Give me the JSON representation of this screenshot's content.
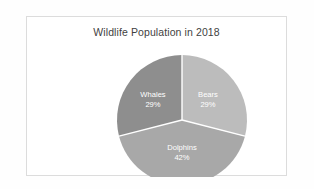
{
  "frame": {
    "border_color": "#dcdcdc",
    "background": "#ffffff"
  },
  "chart_data": {
    "type": "pie",
    "title": "Wildlife Population in 2018",
    "xlabel": "",
    "ylabel": "",
    "legend_position": "none",
    "labels_inside_slices": true,
    "start_angle_deg": 0,
    "direction": "clockwise",
    "categories": [
      "Bears",
      "Dolphins",
      "Whales"
    ],
    "values": [
      29,
      42,
      29
    ],
    "unit": "%",
    "slices": [
      {
        "name": "Bears",
        "value": 29,
        "value_label": "29%",
        "color": "#bcbcbc",
        "start_deg": 0,
        "end_deg": 104.4,
        "label_x": 181,
        "label_y": 78,
        "pct_x": 181,
        "pct_y": 88
      },
      {
        "name": "Dolphins",
        "value": 42,
        "value_label": "42%",
        "color": "#a8a8a8",
        "start_deg": 104.4,
        "end_deg": 255.6,
        "label_x": 155,
        "label_y": 131,
        "pct_x": 155,
        "pct_y": 141
      },
      {
        "name": "Whales",
        "value": 29,
        "value_label": "29%",
        "color": "#8e8e8e",
        "start_deg": 255.6,
        "end_deg": 360,
        "label_x": 126,
        "label_y": 78,
        "pct_x": 126,
        "pct_y": 88
      }
    ],
    "geometry": {
      "center_x": 155,
      "center_y": 103,
      "radius": 65,
      "separator_color": "#ffffff",
      "separator_width": 1.4
    }
  }
}
